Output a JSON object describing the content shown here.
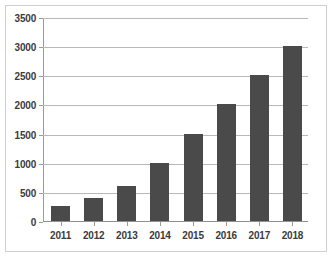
{
  "chart_data": {
    "type": "bar",
    "title": "",
    "subtitle": "",
    "xlabel": "",
    "ylabel": "",
    "categories": [
      "2011",
      "2012",
      "2013",
      "2014",
      "2015",
      "2016",
      "2017",
      "2018"
    ],
    "values": [
      250,
      400,
      600,
      1000,
      1500,
      2000,
      2500,
      3000
    ],
    "series": [
      {
        "name": "",
        "values": [
          250,
          400,
          600,
          1000,
          1500,
          2000,
          2500,
          3000
        ]
      }
    ],
    "ylim": [
      0,
      3500
    ],
    "ytick_values": [
      0,
      500,
      1000,
      1500,
      2000,
      2500,
      3000,
      3500
    ],
    "ytick_labels": [
      "0",
      "500",
      "1000",
      "1500",
      "2000",
      "2500",
      "3000",
      "3500"
    ],
    "xtick_labels": [
      "2011",
      "2012",
      "2013",
      "2014",
      "2015",
      "2016",
      "2017",
      "2018"
    ],
    "grid": true,
    "grid_axis": "y",
    "legend": false,
    "legend_position": "none",
    "annotations": [],
    "colors": {
      "bar": "#4a4a4a",
      "gridline": "#b9b9b9",
      "axis": "#9a9a9a",
      "text": "#3b3b3b",
      "background": "#ffffff",
      "frame": "#cfcfcf"
    }
  }
}
